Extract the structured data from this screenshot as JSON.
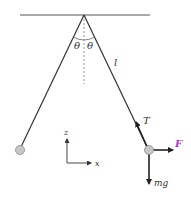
{
  "diagram": {
    "labels": {
      "theta_left": "θ",
      "theta_right": "θ",
      "length": "l",
      "tension": "T",
      "force": "F",
      "weight": "mg",
      "axis_z": "z",
      "axis_x": "x"
    },
    "colors": {
      "line": "#333333",
      "bob_fill": "#c8c8c8",
      "bob_stroke": "#888888",
      "force_F": "#a040c0",
      "arrow": "#222222"
    }
  }
}
